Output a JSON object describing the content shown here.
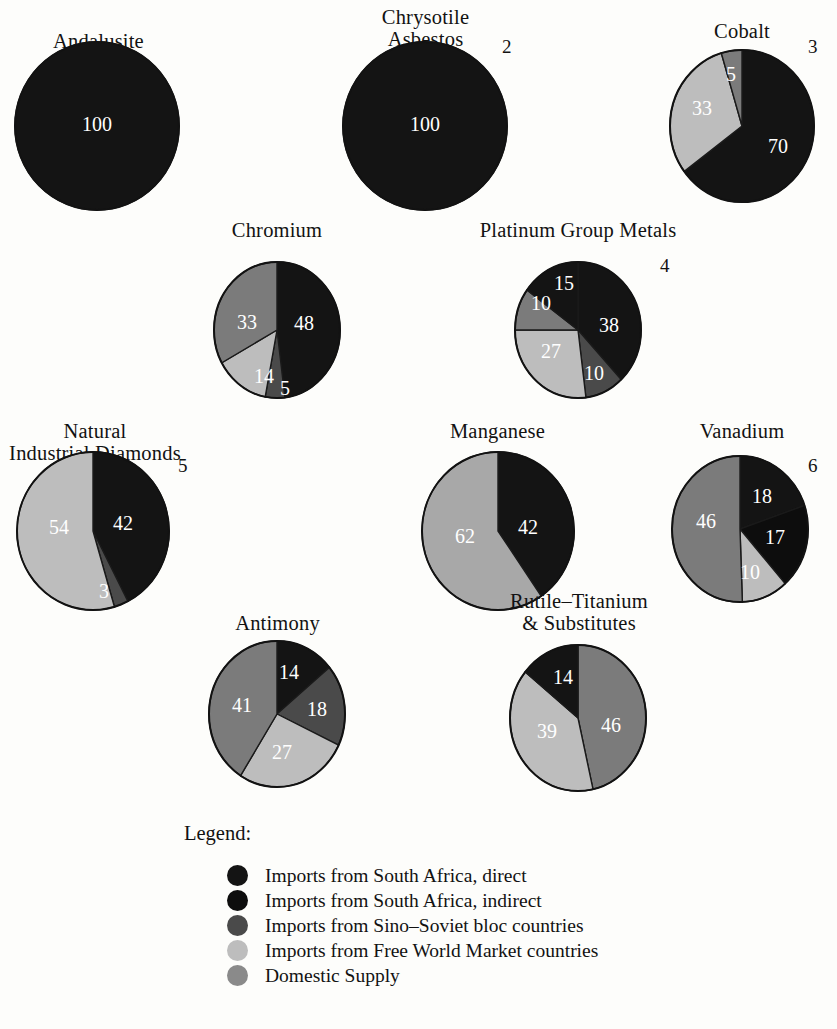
{
  "chart_data": {
    "type": "pie",
    "title": "",
    "legend_position": "bottom-left",
    "legend_heading": "Legend:",
    "categories": [
      "Imports from South Africa, direct",
      "Imports from South Africa, indirect",
      "Imports from Sino–Soviet bloc countries",
      "Imports from Free World Market countries",
      "Domestic Supply"
    ],
    "category_colors": [
      "#141414",
      "#0d0d0d",
      "#4a4a4a",
      "#bdbdbd",
      "#8a8a8a"
    ],
    "charts": [
      {
        "title": "Andalusite",
        "footnote": "",
        "cx": 97,
        "cy": 126,
        "rx": 82,
        "ry": 84,
        "title_x": 16,
        "title_y": 30,
        "title_w": 165,
        "slices": [
          {
            "label": "100",
            "value": 100,
            "category": 0,
            "color": "#141414",
            "start": 0,
            "lx": 0,
            "ly": 0
          }
        ]
      },
      {
        "title": "Chrysotile\nAsbestos",
        "footnote": "2",
        "fx": 502,
        "fy": 36,
        "cx": 425,
        "cy": 126,
        "rx": 82,
        "ry": 84,
        "title_x": 343,
        "title_y": 6,
        "title_w": 165,
        "slices": [
          {
            "label": "100",
            "value": 100,
            "category": 0,
            "color": "#141414",
            "start": 0,
            "lx": 0,
            "ly": 0
          }
        ]
      },
      {
        "title": "Cobalt",
        "footnote": "3",
        "fx": 808,
        "fy": 36,
        "cx": 742,
        "cy": 126,
        "rx": 72,
        "ry": 76,
        "title_x": 672,
        "title_y": 20,
        "title_w": 140,
        "slices": [
          {
            "label": "70",
            "value": 70,
            "category": 0,
            "color": "#141414",
            "start": 0,
            "lx": 36,
            "ly": 22
          },
          {
            "label": "33",
            "value": 33,
            "category": 3,
            "color": "#bdbdbd",
            "start": 70,
            "lx": -40,
            "ly": -16
          },
          {
            "label": "5",
            "value": 5,
            "category": 4,
            "color": "#7b7b7b",
            "start": 103,
            "lx": -11,
            "ly": -50
          }
        ]
      },
      {
        "title": "Chromium",
        "footnote": "",
        "cx": 277,
        "cy": 330,
        "rx": 63,
        "ry": 68,
        "title_x": 202,
        "title_y": 219,
        "title_w": 150,
        "slices": [
          {
            "label": "48",
            "value": 48,
            "category": 0,
            "color": "#141414",
            "start": 0,
            "lx": 27,
            "ly": -5
          },
          {
            "label": "5",
            "value": 5,
            "category": 2,
            "color": "#4a4a4a",
            "start": 48,
            "lx": 8,
            "ly": 60
          },
          {
            "label": "14",
            "value": 14,
            "category": 3,
            "color": "#bdbdbd",
            "start": 53,
            "lx": -13,
            "ly": 48
          },
          {
            "label": "33",
            "value": 33,
            "category": 4,
            "color": "#7b7b7b",
            "start": 67,
            "lx": -30,
            "ly": -6
          }
        ]
      },
      {
        "title": "Platinum Group Metals",
        "footnote": "4",
        "fx": 660,
        "fy": 255,
        "cx": 578,
        "cy": 330,
        "rx": 63,
        "ry": 68,
        "title_x": 452,
        "title_y": 219,
        "title_w": 252,
        "slices": [
          {
            "label": "38",
            "value": 38,
            "category": 0,
            "color": "#141414",
            "start": 0,
            "lx": 31,
            "ly": -3
          },
          {
            "label": "10",
            "value": 10,
            "category": 2,
            "color": "#4a4a4a",
            "start": 38,
            "lx": 16,
            "ly": 45
          },
          {
            "label": "27",
            "value": 27,
            "category": 3,
            "color": "#bdbdbd",
            "start": 48,
            "lx": -27,
            "ly": 23
          },
          {
            "label": "10",
            "value": 10,
            "category": 4,
            "color": "#7b7b7b",
            "start": 75,
            "lx": -37,
            "ly": -25
          },
          {
            "label": "15",
            "value": 15,
            "category": 1,
            "color": "#141414",
            "start": 85,
            "lx": -14,
            "ly": -45
          }
        ]
      },
      {
        "title": "Natural\nIndustrial Diamonds",
        "footnote": "5",
        "fx": 178,
        "fy": 455,
        "cx": 93,
        "cy": 531,
        "rx": 76,
        "ry": 79,
        "title_x": 0,
        "title_y": 420,
        "title_w": 190,
        "slices": [
          {
            "label": "42",
            "value": 42,
            "category": 0,
            "color": "#141414",
            "start": 0,
            "lx": 30,
            "ly": -6
          },
          {
            "label": "3",
            "value": 3,
            "category": 2,
            "color": "#4a4a4a",
            "start": 42,
            "lx": 11,
            "ly": 62
          },
          {
            "label": "54",
            "value": 54,
            "category": 3,
            "color": "#bdbdbd",
            "start": 45,
            "lx": -34,
            "ly": -2
          }
        ]
      },
      {
        "title": "Manganese",
        "footnote": "",
        "cx": 498,
        "cy": 531,
        "rx": 76,
        "ry": 79,
        "title_x": 415,
        "title_y": 420,
        "title_w": 165,
        "slices": [
          {
            "label": "42",
            "value": 42,
            "category": 0,
            "color": "#141414",
            "start": 0,
            "lx": 30,
            "ly": -2
          },
          {
            "label": "62",
            "value": 62,
            "category": 4,
            "color": "#a8a8a8",
            "start": 42,
            "lx": -33,
            "ly": 7
          }
        ]
      },
      {
        "title": "Vanadium",
        "footnote": "6",
        "fx": 808,
        "fy": 455,
        "cx": 740,
        "cy": 529,
        "rx": 68,
        "ry": 73,
        "title_x": 668,
        "title_y": 420,
        "title_w": 148,
        "slices": [
          {
            "label": "18",
            "value": 18,
            "category": 0,
            "color": "#141414",
            "start": 0,
            "lx": 22,
            "ly": -31
          },
          {
            "label": "17",
            "value": 17,
            "category": 1,
            "color": "#0d0d0d",
            "start": 18,
            "lx": 35,
            "ly": 10
          },
          {
            "label": "10",
            "value": 10,
            "category": 3,
            "color": "#bdbdbd",
            "start": 35,
            "lx": 10,
            "ly": 45
          },
          {
            "label": "46",
            "value": 46,
            "category": 4,
            "color": "#7b7b7b",
            "start": 45,
            "lx": -34,
            "ly": -6
          }
        ]
      },
      {
        "title": "Antimony",
        "footnote": "",
        "cx": 277,
        "cy": 714,
        "rx": 68,
        "ry": 73,
        "title_x": 205,
        "title_y": 612,
        "title_w": 145,
        "slices": [
          {
            "label": "14",
            "value": 14,
            "category": 0,
            "color": "#141414",
            "start": 0,
            "lx": 12,
            "ly": -40
          },
          {
            "label": "18",
            "value": 18,
            "category": 2,
            "color": "#4a4a4a",
            "start": 14,
            "lx": 40,
            "ly": -3
          },
          {
            "label": "27",
            "value": 27,
            "category": 3,
            "color": "#bdbdbd",
            "start": 32,
            "lx": 5,
            "ly": 40
          },
          {
            "label": "41",
            "value": 41,
            "category": 4,
            "color": "#7b7b7b",
            "start": 59,
            "lx": -35,
            "ly": -7
          }
        ]
      },
      {
        "title": "Rutile–Titanium\n& Substitutes",
        "footnote": "",
        "cx": 578,
        "cy": 718,
        "rx": 68,
        "ry": 73,
        "title_x": 470,
        "title_y": 590,
        "title_w": 218,
        "slices": [
          {
            "label": "46",
            "value": 46,
            "category": 4,
            "color": "#7b7b7b",
            "start": 0,
            "lx": 33,
            "ly": 9
          },
          {
            "label": "39",
            "value": 39,
            "category": 3,
            "color": "#bdbdbd",
            "start": 46,
            "lx": -31,
            "ly": 15
          },
          {
            "label": "14",
            "value": 14,
            "category": 0,
            "color": "#141414",
            "start": 85,
            "lx": -15,
            "ly": -39
          }
        ]
      }
    ]
  }
}
